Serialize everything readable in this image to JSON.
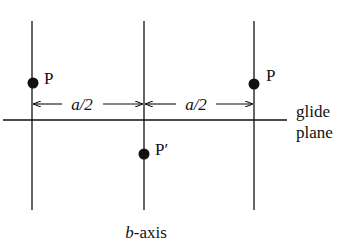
{
  "diagram": {
    "type": "glide-plane-symmetry",
    "colors": {
      "ink": "#111111",
      "background": "#ffffff"
    },
    "vertical_lines": [
      {
        "x": 32,
        "y1": 21,
        "y2": 210
      },
      {
        "x": 144,
        "y1": 21,
        "y2": 210
      },
      {
        "x": 254,
        "y1": 21,
        "y2": 210
      }
    ],
    "glide_plane_line": {
      "y": 120,
      "x1": 3,
      "x2": 287
    },
    "points": [
      {
        "label": "P",
        "x": 33,
        "y": 83
      },
      {
        "label": "P′",
        "x": 144,
        "y": 154
      },
      {
        "label": "P",
        "x": 254,
        "y": 84
      }
    ],
    "dimensions": [
      {
        "label": "a/2",
        "x1": 32,
        "x2": 144,
        "y": 104
      },
      {
        "label": "a/2",
        "x1": 144,
        "x2": 254,
        "y": 104
      }
    ],
    "labels": {
      "glide_line1": "glide",
      "glide_line2": "plane",
      "axis_italic": "b",
      "axis_rest": "-axis"
    },
    "point_labels": {
      "p_left": "P",
      "p_prime": "P′",
      "p_right": "P"
    },
    "dim_labels": {
      "left": "a/2",
      "right": "a/2"
    }
  }
}
